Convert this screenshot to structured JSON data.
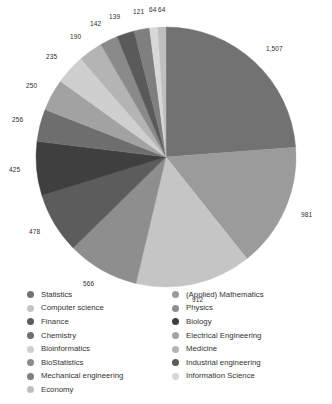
{
  "chart_data": {
    "type": "pie",
    "title": "",
    "subtitle": "",
    "xlabel": "",
    "ylabel": "",
    "legend_position": "bottom",
    "grid": false,
    "start_angle_deg": 0,
    "direction": "clockwise",
    "categories": [
      "Statistics",
      "(Applied) Mathematics",
      "Computer science",
      "Physics",
      "Finance",
      "Biology",
      "Chemistry",
      "Electrical Engineering",
      "Bioinformatics",
      "Medicine",
      "BioStatistics",
      "Industrial engineering",
      "Mechanical engineering",
      "Information Science",
      "Economy"
    ],
    "values": [
      1507,
      981,
      912,
      566,
      478,
      425,
      256,
      250,
      235,
      190,
      142,
      139,
      121,
      64,
      64
    ],
    "labels": [
      "1,507",
      "981",
      "912",
      "566",
      "478",
      "425",
      "256",
      "250",
      "235",
      "190",
      "142",
      "139",
      "121",
      "64",
      "64"
    ],
    "colors": [
      "#727272",
      "#9b9b9b",
      "#c5c5c5",
      "#8e8e8e",
      "#5c5c5c",
      "#3f3f3f",
      "#6e6e6e",
      "#a2a2a2",
      "#cfcfcf",
      "#b4b4b4",
      "#8a8a8a",
      "#5a5a5a",
      "#7f7f7f",
      "#d8d8d8",
      "#bfbfbf"
    ],
    "slices": [
      {
        "name": "Statistics",
        "value": 1507,
        "label": "1,507",
        "color": "#727272"
      },
      {
        "name": "(Applied) Mathematics",
        "value": 981,
        "label": "981",
        "color": "#9b9b9b"
      },
      {
        "name": "Computer science",
        "value": 912,
        "label": "912",
        "color": "#c5c5c5"
      },
      {
        "name": "Physics",
        "value": 566,
        "label": "566",
        "color": "#8e8e8e"
      },
      {
        "name": "Finance",
        "value": 478,
        "label": "478",
        "color": "#5c5c5c"
      },
      {
        "name": "Biology",
        "value": 425,
        "label": "425",
        "color": "#3f3f3f"
      },
      {
        "name": "Chemistry",
        "value": 256,
        "label": "256",
        "color": "#6e6e6e"
      },
      {
        "name": "Electrical Engineering",
        "value": 250,
        "label": "250",
        "color": "#a2a2a2"
      },
      {
        "name": "Bioinformatics",
        "value": 235,
        "label": "235",
        "color": "#cfcfcf"
      },
      {
        "name": "Medicine",
        "value": 190,
        "label": "190",
        "color": "#b4b4b4"
      },
      {
        "name": "BioStatistics",
        "value": 142,
        "label": "142",
        "color": "#8a8a8a"
      },
      {
        "name": "Industrial engineering",
        "value": 139,
        "label": "139",
        "color": "#5a5a5a"
      },
      {
        "name": "Mechanical engineering",
        "value": 121,
        "label": "121",
        "color": "#7f7f7f"
      },
      {
        "name": "Information Science",
        "value": 64,
        "label": "64",
        "color": "#d8d8d8"
      },
      {
        "name": "Economy",
        "value": 64,
        "label": "64",
        "color": "#bfbfbf"
      }
    ]
  },
  "legend": {
    "left_column": [
      {
        "label": "Statistics",
        "color": "#727272"
      },
      {
        "label": "Computer science",
        "color": "#c5c5c5"
      },
      {
        "label": "Finance",
        "color": "#5c5c5c"
      },
      {
        "label": "Chemistry",
        "color": "#6e6e6e"
      },
      {
        "label": "Bioinformatics",
        "color": "#cfcfcf"
      },
      {
        "label": "BioStatistics",
        "color": "#8a8a8a"
      },
      {
        "label": "Mechanical engineering",
        "color": "#7f7f7f"
      },
      {
        "label": "Economy",
        "color": "#bfbfbf"
      }
    ],
    "right_column": [
      {
        "label": "(Applied) Mathematics",
        "color": "#9b9b9b"
      },
      {
        "label": "Physics",
        "color": "#8e8e8e"
      },
      {
        "label": "Biology",
        "color": "#3f3f3f"
      },
      {
        "label": "Electrical Engineering",
        "color": "#a2a2a2"
      },
      {
        "label": "Medicine",
        "color": "#b4b4b4"
      },
      {
        "label": "Industrial engineering",
        "color": "#5a5a5a"
      },
      {
        "label": "Information Science",
        "color": "#d8d8d8"
      }
    ]
  }
}
